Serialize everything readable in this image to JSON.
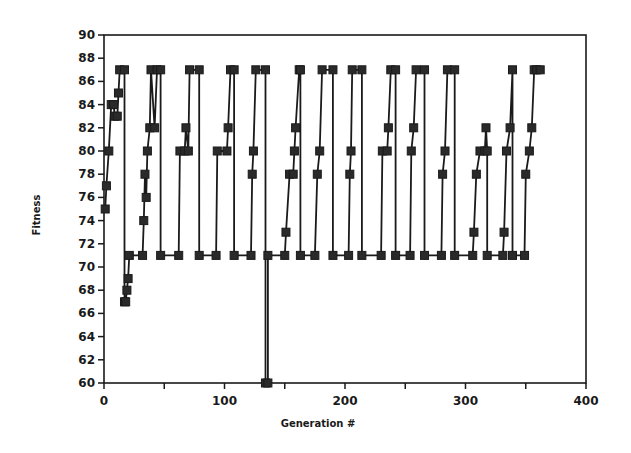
{
  "chart_data": {
    "type": "line",
    "title": "",
    "xlabel": "Generation #",
    "ylabel": "Fitness",
    "xlim": [
      0,
      400
    ],
    "ylim": [
      60,
      90
    ],
    "xticks": [
      0,
      50,
      100,
      150,
      200,
      250,
      300,
      350,
      400
    ],
    "xtick_labels": [
      "0",
      "",
      "100",
      "",
      "200",
      "",
      "300",
      "",
      "400"
    ],
    "yticks": [
      60,
      62,
      64,
      66,
      68,
      70,
      72,
      74,
      76,
      78,
      80,
      82,
      84,
      86,
      88,
      90
    ],
    "ytick_labels": [
      "60",
      "62",
      "64",
      "66",
      "68",
      "70",
      "72",
      "74",
      "76",
      "78",
      "80",
      "82",
      "84",
      "86",
      "88",
      "90"
    ],
    "grid": false,
    "legend": null,
    "marker": "square",
    "series": [
      {
        "name": "Fitness",
        "points": [
          [
            1,
            75
          ],
          [
            2,
            77
          ],
          [
            4,
            80
          ],
          [
            6,
            84
          ],
          [
            8,
            84
          ],
          [
            9,
            83
          ],
          [
            11,
            83
          ],
          [
            12,
            85
          ],
          [
            13,
            87
          ],
          [
            17,
            87
          ],
          [
            17,
            67
          ],
          [
            18,
            67
          ],
          [
            19,
            68
          ],
          [
            20,
            69
          ],
          [
            21,
            71
          ],
          [
            32,
            71
          ],
          [
            33,
            74
          ],
          [
            34,
            78
          ],
          [
            35,
            76
          ],
          [
            36,
            80
          ],
          [
            38,
            82
          ],
          [
            39,
            87
          ],
          [
            42,
            82
          ],
          [
            44,
            87
          ],
          [
            47,
            87
          ],
          [
            47,
            71
          ],
          [
            62,
            71
          ],
          [
            63,
            80
          ],
          [
            67,
            80
          ],
          [
            68,
            82
          ],
          [
            70,
            80
          ],
          [
            71,
            87
          ],
          [
            79,
            87
          ],
          [
            79,
            71
          ],
          [
            93,
            71
          ],
          [
            94,
            80
          ],
          [
            102,
            80
          ],
          [
            103,
            82
          ],
          [
            105,
            87
          ],
          [
            108,
            87
          ],
          [
            108,
            71
          ],
          [
            122,
            71
          ],
          [
            123,
            78
          ],
          [
            124,
            80
          ],
          [
            126,
            87
          ],
          [
            134,
            87
          ],
          [
            134,
            60
          ],
          [
            136,
            60
          ],
          [
            136,
            71
          ],
          [
            150,
            71
          ],
          [
            151,
            73
          ],
          [
            154,
            78
          ],
          [
            157,
            78
          ],
          [
            158,
            80
          ],
          [
            159,
            82
          ],
          [
            162,
            87
          ],
          [
            163,
            87
          ],
          [
            163,
            71
          ],
          [
            175,
            71
          ],
          [
            177,
            78
          ],
          [
            179,
            80
          ],
          [
            181,
            87
          ],
          [
            190,
            87
          ],
          [
            190,
            71
          ],
          [
            203,
            71
          ],
          [
            204,
            78
          ],
          [
            205,
            80
          ],
          [
            206,
            87
          ],
          [
            214,
            87
          ],
          [
            214,
            71
          ],
          [
            230,
            71
          ],
          [
            231,
            80
          ],
          [
            235,
            80
          ],
          [
            236,
            82
          ],
          [
            238,
            87
          ],
          [
            242,
            87
          ],
          [
            242,
            71
          ],
          [
            254,
            71
          ],
          [
            255,
            80
          ],
          [
            257,
            82
          ],
          [
            259,
            87
          ],
          [
            266,
            87
          ],
          [
            266,
            71
          ],
          [
            280,
            71
          ],
          [
            281,
            78
          ],
          [
            283,
            80
          ],
          [
            285,
            87
          ],
          [
            291,
            87
          ],
          [
            291,
            71
          ],
          [
            306,
            71
          ],
          [
            307,
            73
          ],
          [
            309,
            78
          ],
          [
            312,
            80
          ],
          [
            316,
            80
          ],
          [
            317,
            82
          ],
          [
            318,
            80
          ],
          [
            318,
            71
          ],
          [
            331,
            71
          ],
          [
            332,
            73
          ],
          [
            334,
            80
          ],
          [
            337,
            82
          ],
          [
            339,
            87
          ],
          [
            339,
            71
          ],
          [
            349,
            71
          ],
          [
            350,
            78
          ],
          [
            353,
            80
          ],
          [
            355,
            82
          ],
          [
            357,
            87
          ],
          [
            359,
            87
          ],
          [
            362,
            87
          ]
        ]
      }
    ]
  }
}
